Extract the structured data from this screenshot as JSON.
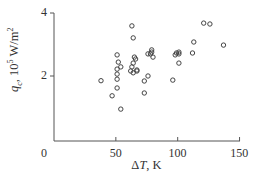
{
  "chart_data": {
    "type": "scatter",
    "title": "",
    "xlabel": "ΔT, K",
    "ylabel": "q_c, 10^5 W/m^2",
    "xlim": [
      0,
      150
    ],
    "ylim": [
      0,
      4
    ],
    "x_ticks": [
      0,
      50,
      100,
      150
    ],
    "y_ticks": [
      2,
      4
    ],
    "y_tick_zero_label": "0",
    "grid": false,
    "legend": null,
    "marker": "open-circle",
    "series": [
      {
        "name": "q_c",
        "points": [
          [
            38,
            1.85
          ],
          [
            47,
            1.37
          ],
          [
            51,
            2.67
          ],
          [
            52,
            2.44
          ],
          [
            51,
            2.22
          ],
          [
            54,
            2.29
          ],
          [
            51,
            2.06
          ],
          [
            51,
            1.9
          ],
          [
            51,
            1.62
          ],
          [
            54,
            0.95
          ],
          [
            63,
            3.59
          ],
          [
            64,
            3.21
          ],
          [
            62,
            2.16
          ],
          [
            63,
            2.29
          ],
          [
            64,
            2.41
          ],
          [
            65,
            2.6
          ],
          [
            66,
            2.54
          ],
          [
            67,
            2.19
          ],
          [
            64,
            2.1
          ],
          [
            67,
            2.16
          ],
          [
            73,
            1.46
          ],
          [
            73,
            1.84
          ],
          [
            76,
            2.0
          ],
          [
            76,
            2.7
          ],
          [
            78,
            2.7
          ],
          [
            79,
            2.83
          ],
          [
            79,
            2.76
          ],
          [
            80,
            2.6
          ],
          [
            96,
            1.87
          ],
          [
            98,
            2.67
          ],
          [
            99,
            2.73
          ],
          [
            101,
            2.76
          ],
          [
            101,
            2.7
          ],
          [
            101,
            2.41
          ],
          [
            112,
            2.73
          ],
          [
            113,
            3.08
          ],
          [
            121,
            3.68
          ],
          [
            126,
            3.65
          ],
          [
            137,
            2.98
          ]
        ]
      }
    ]
  },
  "axes": {
    "x_tick_labels": [
      "0",
      "50",
      "100",
      "150"
    ],
    "y_tick_labels": [
      "2",
      "4"
    ],
    "xlabel_prefix": "Δ",
    "xlabel_var": "T",
    "xlabel_suffix": ", K",
    "ylabel_var": "q",
    "ylabel_sub": "c",
    "ylabel_mid": ", 10",
    "ylabel_exp": "5",
    "ylabel_unit": " W/m",
    "ylabel_unit_exp": "2"
  },
  "colors": {
    "axis": "#555555",
    "marker": "#444444",
    "text": "#333333"
  }
}
